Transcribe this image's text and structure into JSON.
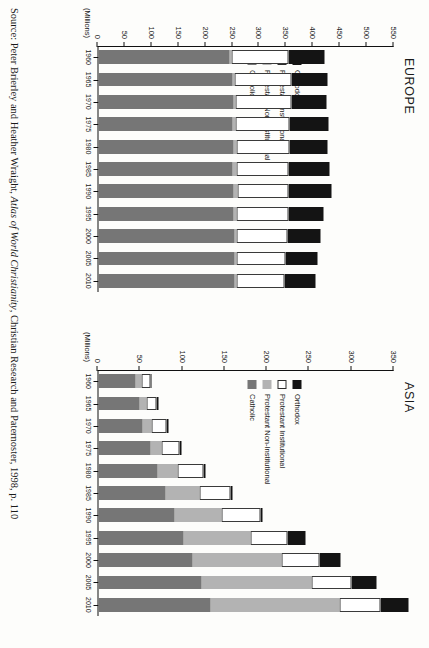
{
  "source": {
    "prefix": "Source:",
    "authors": "Peter Brierley and Heather Wraight,",
    "title": "Atlas of World Christianity",
    "publisher": ", Christian Research and Paternoster, 1998, p. 110"
  },
  "legend": {
    "items": [
      {
        "key": "orth",
        "label": "Orthodox",
        "color": "#141414"
      },
      {
        "key": "pi",
        "label": "Protestant Institutional",
        "color": "#ffffff"
      },
      {
        "key": "pni",
        "label": "Protestant Non-Institutional",
        "color": "#b3b3b3"
      },
      {
        "key": "catholic",
        "label": "Catholic",
        "color": "#767676"
      }
    ]
  },
  "chart_data": [
    {
      "type": "bar",
      "title": "EUROPE",
      "stacked": true,
      "units_label": "(Millions)",
      "xlabel": "",
      "ylabel": "(Millions)",
      "ylim": [
        0,
        550
      ],
      "yticks": [
        0,
        50,
        100,
        150,
        200,
        250,
        300,
        350,
        400,
        450,
        500,
        550
      ],
      "grid": false,
      "legend_position": "inside-left",
      "categories": [
        "1960",
        "1965",
        "1970",
        "1975",
        "1980",
        "1985",
        "1990",
        "1995",
        "2000",
        "2005",
        "2010"
      ],
      "series": [
        {
          "name": "Catholic",
          "values": [
            243,
            249,
            250,
            249,
            250,
            249,
            251,
            251,
            252,
            252,
            252
          ]
        },
        {
          "name": "Protestant Non-Institutional",
          "values": [
            5,
            3,
            4,
            5,
            6,
            7,
            8,
            6,
            5,
            5,
            5
          ]
        },
        {
          "name": "Protestant Institutional",
          "values": [
            106,
            107,
            104,
            101,
            99,
            97,
            94,
            96,
            94,
            90,
            88
          ]
        },
        {
          "name": "Orthodox",
          "values": [
            66,
            66,
            66,
            72,
            70,
            76,
            80,
            66,
            62,
            60,
            58
          ]
        }
      ],
      "totals": [
        420,
        425,
        424,
        427,
        425,
        429,
        433,
        419,
        413,
        407,
        403
      ]
    },
    {
      "type": "bar",
      "title": "ASIA",
      "stacked": true,
      "units_label": "(Millions)",
      "xlabel": "",
      "ylabel": "(Millions)",
      "ylim": [
        0,
        350
      ],
      "yticks": [
        0,
        50,
        100,
        150,
        200,
        250,
        300,
        350
      ],
      "grid": false,
      "legend_position": "inside-left",
      "categories": [
        "1960",
        "1965",
        "1970",
        "1975",
        "1980",
        "1985",
        "1990",
        "1995",
        "2000",
        "2005",
        "2010"
      ],
      "series": [
        {
          "name": "Catholic",
          "values": [
            44,
            49,
            52,
            61,
            70,
            79,
            90,
            100,
            111,
            122,
            133
          ]
        },
        {
          "name": "Protestant Non-Institutional",
          "values": [
            7,
            8,
            11,
            13,
            24,
            40,
            56,
            80,
            105,
            130,
            152
          ]
        },
        {
          "name": "Protestant Institutional",
          "values": [
            10,
            12,
            18,
            22,
            30,
            37,
            45,
            43,
            45,
            47,
            48
          ]
        },
        {
          "name": "Orthodox",
          "values": [
            2,
            2,
            2,
            2,
            3,
            3,
            3,
            22,
            25,
            30,
            33
          ]
        }
      ],
      "totals": [
        63,
        71,
        83,
        98,
        127,
        159,
        194,
        245,
        286,
        329,
        366
      ]
    }
  ]
}
